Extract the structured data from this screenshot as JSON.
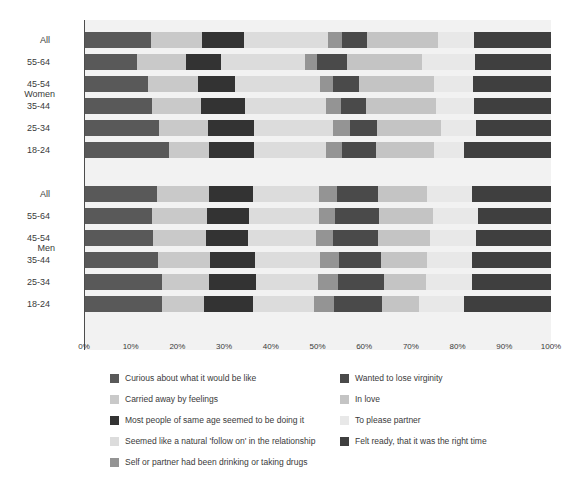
{
  "chart_data": {
    "type": "bar",
    "subtype": "stacked-horizontal-percent",
    "title": "",
    "xlabel": "",
    "ylabel": "",
    "xlim": [
      0,
      100
    ],
    "xticks": [
      "0%",
      "10%",
      "20%",
      "30%",
      "40%",
      "50%",
      "60%",
      "70%",
      "80%",
      "90%",
      "100%"
    ],
    "grid": false,
    "legend_position": "bottom",
    "groups": [
      "Women",
      "Men"
    ],
    "categories": [
      "All",
      "55-64",
      "45-54",
      "35-44",
      "25-34",
      "18-24"
    ],
    "series": [
      {
        "name": "Curious about what it would be like",
        "color": "#595959"
      },
      {
        "name": "Carried away by feelings",
        "color": "#c9c9c9"
      },
      {
        "name": "Most people of same age seemed to be doing it",
        "color": "#333333"
      },
      {
        "name": "Seemed like a natural 'follow on' in the relationship",
        "color": "#dcdcdc"
      },
      {
        "name": "Self or partner had been drinking or taking drugs",
        "color": "#949494"
      },
      {
        "name": "Wanted to lose virginity",
        "color": "#4a4a4a"
      },
      {
        "name": "In love",
        "color": "#c4c4c4"
      },
      {
        "name": "To please partner",
        "color": "#e8e8e8"
      },
      {
        "name": "Felt ready, that it was the right time",
        "color": "#3f3f3f"
      }
    ],
    "rows": [
      {
        "group": "Women",
        "category": "All",
        "values": [
          14.3,
          11.0,
          9.0,
          18.0,
          3.0,
          5.4,
          15.0,
          7.9,
          16.4
        ]
      },
      {
        "group": "Women",
        "category": "55-64",
        "values": [
          11.4,
          10.4,
          7.5,
          18.0,
          2.5,
          6.5,
          16.0,
          11.4,
          16.3
        ]
      },
      {
        "group": "Women",
        "category": "45-54",
        "values": [
          13.7,
          10.7,
          8.0,
          18.2,
          2.8,
          5.5,
          16.0,
          8.5,
          16.6
        ]
      },
      {
        "group": "Women",
        "category": "35-44",
        "values": [
          14.5,
          10.5,
          9.5,
          17.4,
          3.2,
          5.2,
          15.0,
          8.2,
          16.5
        ]
      },
      {
        "group": "Women",
        "category": "25-34",
        "values": [
          16.0,
          10.5,
          10.0,
          16.8,
          3.6,
          5.8,
          13.8,
          7.5,
          16.0
        ]
      },
      {
        "group": "Women",
        "category": "18-24",
        "values": [
          18.2,
          8.6,
          9.6,
          15.4,
          3.4,
          7.3,
          12.4,
          6.5,
          18.6
        ]
      },
      {
        "group": "Men",
        "category": "All",
        "values": [
          15.6,
          11.2,
          9.4,
          14.1,
          3.9,
          8.8,
          10.5,
          9.6,
          16.9
        ]
      },
      {
        "group": "Men",
        "category": "55-64",
        "values": [
          14.6,
          11.7,
          9.1,
          14.9,
          3.4,
          9.4,
          11.6,
          9.6,
          15.7
        ]
      },
      {
        "group": "Men",
        "category": "45-54",
        "values": [
          14.8,
          11.3,
          9.0,
          14.6,
          3.6,
          9.7,
          11.0,
          10.0,
          16.0
        ]
      },
      {
        "group": "Men",
        "category": "35-44",
        "values": [
          15.9,
          11.0,
          9.7,
          13.9,
          4.0,
          9.0,
          10.0,
          9.5,
          17.0
        ]
      },
      {
        "group": "Men",
        "category": "25-34",
        "values": [
          16.6,
          10.2,
          10.0,
          13.4,
          4.2,
          9.8,
          9.0,
          9.8,
          17.0
        ]
      },
      {
        "group": "Men",
        "category": "18-24",
        "values": [
          16.8,
          9.0,
          10.4,
          13.0,
          4.4,
          10.2,
          8.0,
          9.5,
          18.7
        ]
      }
    ]
  },
  "axis": {
    "group_women": "Women",
    "group_men": "Men"
  },
  "legend": {
    "left_items": [
      {
        "label": "Curious about what it would be like",
        "color": "#595959"
      },
      {
        "label": "Carried away by feelings",
        "color": "#c9c9c9"
      },
      {
        "label": "Most people of same age seemed to be doing it",
        "color": "#333333"
      },
      {
        "label": "Seemed like a natural 'follow on' in the relationship",
        "color": "#dcdcdc"
      },
      {
        "label": "Self or partner had been drinking or taking drugs",
        "color": "#949494"
      }
    ],
    "right_items": [
      {
        "label": "Wanted to lose virginity",
        "color": "#4a4a4a"
      },
      {
        "label": "In love",
        "color": "#c4c4c4"
      },
      {
        "label": "To please partner",
        "color": "#e8e8e8"
      },
      {
        "label": "Felt ready, that it was the right time",
        "color": "#3f3f3f"
      }
    ]
  }
}
